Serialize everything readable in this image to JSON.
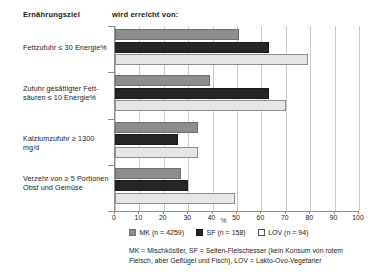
{
  "headers": {
    "goal": "Ernährungsziel",
    "reached_by": "wird erreicht von:"
  },
  "legend": {
    "items": [
      {
        "key": "MK",
        "label": "MK (n = 4259)",
        "color": "#8d8d8d"
      },
      {
        "key": "SF",
        "label": "SF (n = 158)",
        "color": "#262626"
      },
      {
        "key": "LOV",
        "label": "LOV (n = 94)",
        "color": "#ffffff"
      }
    ]
  },
  "footnote": "MK = Mischköstler, SF = Selten-Fleischesser (kein Konsum von rotem Fleisch, aber Geflügel und Fisch), LOV = Lakto-Ovo-Vegetarier",
  "axis": {
    "unit": "%",
    "ticks": [
      "0",
      "10",
      "20",
      "30",
      "40",
      "50",
      "60",
      "70",
      "80",
      "90",
      "100"
    ]
  },
  "chart_data": {
    "type": "bar",
    "orientation": "horizontal",
    "title": "",
    "subtitle": "",
    "xlabel": "%",
    "ylabel": "Ernährungsziel",
    "xlim": [
      0,
      100
    ],
    "grid": true,
    "legend_position": "bottom",
    "categories": [
      "Fettzufuhr ≤ 30 Energie%",
      "Zufuhr gesättigter Fett-\nsäuren ≤ 10 Energie%",
      "Kalziumzufuhr ≥ 1300 mg/d",
      "Verzehr von ≥ 5 Portionen\nObst und Gemüse"
    ],
    "series": [
      {
        "name": "MK (n = 4259)",
        "key": "MK",
        "values": [
          51,
          39,
          34,
          27
        ]
      },
      {
        "name": "SF (n = 158)",
        "key": "SF",
        "values": [
          63,
          63,
          26,
          30
        ]
      },
      {
        "name": "LOV (n = 94)",
        "key": "LOV",
        "values": [
          79,
          70,
          34,
          49
        ]
      }
    ]
  }
}
